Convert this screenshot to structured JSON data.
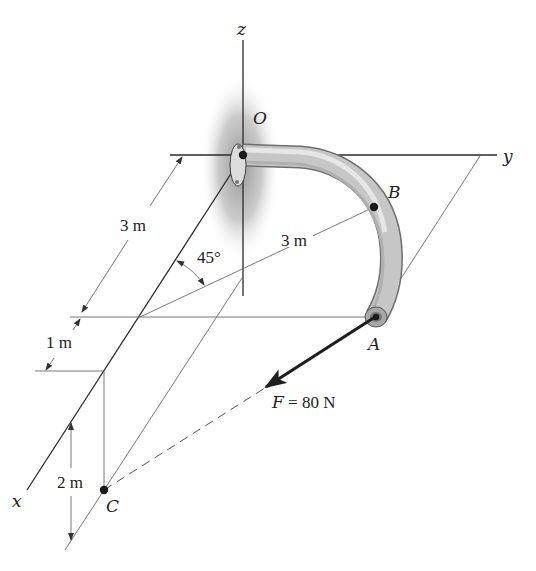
{
  "figure": {
    "axes": {
      "x": "x",
      "y": "y",
      "z": "z"
    },
    "points": {
      "O": "O",
      "A": "A",
      "B": "B",
      "C": "C"
    },
    "dimensions": {
      "x_to_A_row": "3 m",
      "x_to_C_row": "1 m",
      "C_below_x": "2 m",
      "radius_to_B": "3 m"
    },
    "angle": "45°",
    "force": {
      "symbol": "F",
      "value": " = 80 N"
    },
    "colors": {
      "line": "#2a2a2a",
      "pipe": "#c6c6c6",
      "pipe_outline": "#6e6e6e",
      "wall_shading": "#9a9a9a"
    }
  }
}
